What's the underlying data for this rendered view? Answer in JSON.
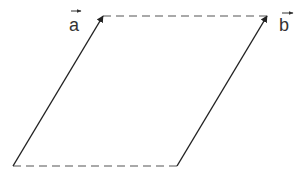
{
  "diagram": {
    "type": "parallelogram-vectors",
    "vectors": [
      {
        "name": "a",
        "label": "a",
        "from": [
          13,
          166
        ],
        "to": [
          103,
          16
        ]
      },
      {
        "name": "b",
        "label": "b",
        "from": [
          177,
          166
        ],
        "to": [
          267,
          16
        ]
      }
    ],
    "dashed_edges": [
      {
        "from": [
          103,
          16
        ],
        "to": [
          267,
          16
        ]
      },
      {
        "from": [
          13,
          166
        ],
        "to": [
          177,
          166
        ]
      }
    ],
    "colors": {
      "line": "#222222",
      "dash": "#555555"
    }
  }
}
